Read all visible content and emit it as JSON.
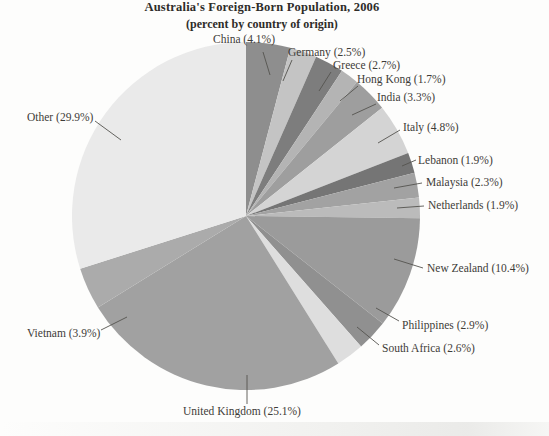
{
  "chart_data": {
    "type": "pie",
    "title": "Australia's Foreign-Born Population, 2006",
    "subtitle": "(percent by country of origin)",
    "start_angle_deg": 0,
    "direction": "clockwise",
    "legend": "none",
    "label_format": "{label} ({value}%)",
    "slices": [
      {
        "label": "China",
        "value": 4.1,
        "color": "#8e8e8e"
      },
      {
        "label": "Germany",
        "value": 2.5,
        "color": "#c4c4c4"
      },
      {
        "label": "Greece",
        "value": 2.7,
        "color": "#7d7d7d"
      },
      {
        "label": "Hong Kong",
        "value": 1.7,
        "color": "#b4b4b4"
      },
      {
        "label": "India",
        "value": 3.3,
        "color": "#9e9e9e"
      },
      {
        "label": "Italy",
        "value": 4.8,
        "color": "#d4d4d4"
      },
      {
        "label": "Lebanon",
        "value": 1.9,
        "color": "#757575"
      },
      {
        "label": "Malaysia",
        "value": 2.3,
        "color": "#a2a2a2"
      },
      {
        "label": "Netherlands",
        "value": 1.9,
        "color": "#bbbbbb"
      },
      {
        "label": "New Zealand",
        "value": 10.4,
        "color": "#9b9b9b"
      },
      {
        "label": "Philippines",
        "value": 2.9,
        "color": "#909090"
      },
      {
        "label": "South Africa",
        "value": 2.6,
        "color": "#dedede"
      },
      {
        "label": "United Kingdom",
        "value": 25.1,
        "color": "#a1a1a1"
      },
      {
        "label": "Vietnam",
        "value": 3.9,
        "color": "#ababab"
      },
      {
        "label": "Other",
        "value": 29.9,
        "color": "#eaeaea"
      }
    ]
  },
  "style": {
    "text_color": "#3e3c38",
    "leader_color": "#55534f",
    "background": "#fdfdfc"
  }
}
